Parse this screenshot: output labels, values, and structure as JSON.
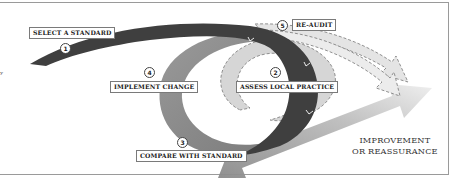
{
  "diagram": {
    "type": "audit-cycle",
    "steps": [
      {
        "number": "1",
        "label": "SELECT A STANDARD"
      },
      {
        "number": "2",
        "label": "ASSESS LOCAL PRACTICE"
      },
      {
        "number": "3",
        "label": "COMPARE WITH STANDARD"
      },
      {
        "number": "4",
        "label": "IMPLEMENT CHANGE"
      },
      {
        "number": "5",
        "label": "RE-AUDIT"
      }
    ],
    "outcome": {
      "line1": "IMPROVEMENT",
      "line2": "OR REASSURANCE"
    },
    "colors": {
      "dark_band": "#3d3d3d",
      "mid_band": "#8c8c8c",
      "light_band": "#d4d4d4",
      "arrow": "#a8a8a8",
      "border": "#9a9a9a"
    }
  }
}
